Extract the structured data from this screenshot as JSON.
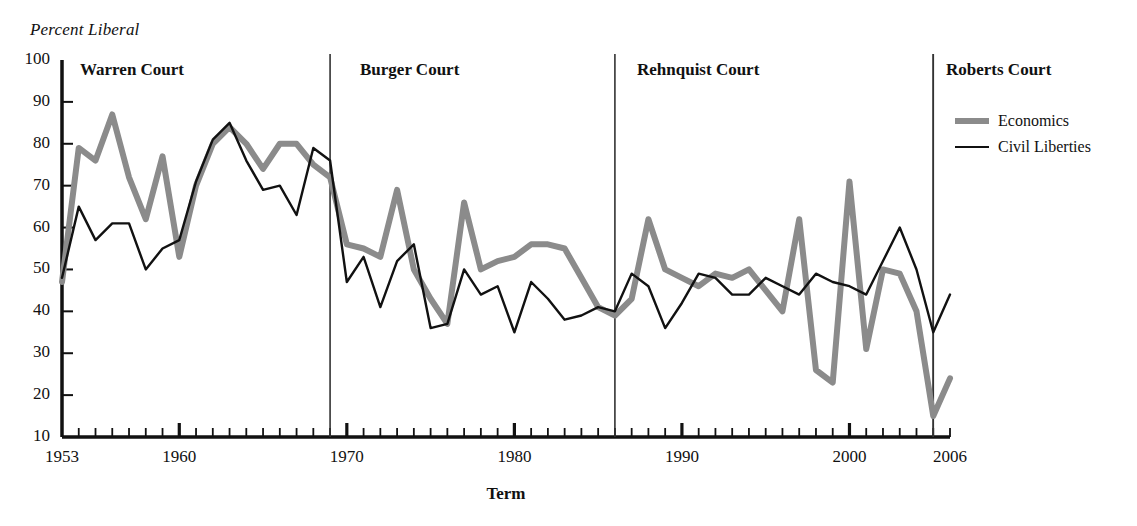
{
  "axis_title_y": "Percent Liberal",
  "axis_title_x": "Term",
  "legend": {
    "items": [
      {
        "label": "Economics",
        "color": "#8b8b8b",
        "style": "thick"
      },
      {
        "label": "Civil Liberties",
        "color": "#111111",
        "style": "thin"
      }
    ]
  },
  "courts": [
    {
      "name": "Warren Court",
      "start_year": 1953,
      "divider_year": null
    },
    {
      "name": "Burger Court",
      "start_year": 1969,
      "divider_year": 1969
    },
    {
      "name": "Rehnquist Court",
      "start_year": 1986,
      "divider_year": 1986
    },
    {
      "name": "Roberts Court",
      "start_year": 2005,
      "divider_year": 2005
    }
  ],
  "y_ticks": [
    10,
    20,
    30,
    40,
    50,
    60,
    70,
    80,
    90,
    100
  ],
  "x_tick_labels": [
    {
      "year": 1953,
      "text": "1953"
    },
    {
      "year": 1960,
      "text": "1960"
    },
    {
      "year": 1970,
      "text": "1970"
    },
    {
      "year": 1980,
      "text": "1980"
    },
    {
      "year": 1990,
      "text": "1990"
    },
    {
      "year": 2000,
      "text": "2000"
    },
    {
      "year": 2006,
      "text": "2006"
    }
  ],
  "colors": {
    "economics": "#8b8b8b",
    "civil_liberties": "#111111",
    "axis": "#111111",
    "divider": "#333333",
    "background": "#ffffff"
  },
  "chart_data": {
    "type": "line",
    "title": "",
    "xlabel": "Term",
    "ylabel": "Percent Liberal",
    "xlim": [
      1953,
      2006
    ],
    "ylim": [
      10,
      100
    ],
    "grid": false,
    "legend_position": "right",
    "x": [
      1953,
      1954,
      1955,
      1956,
      1957,
      1958,
      1959,
      1960,
      1961,
      1962,
      1963,
      1964,
      1965,
      1966,
      1967,
      1968,
      1969,
      1970,
      1971,
      1972,
      1973,
      1974,
      1975,
      1976,
      1977,
      1978,
      1979,
      1980,
      1981,
      1982,
      1983,
      1984,
      1985,
      1986,
      1987,
      1988,
      1989,
      1990,
      1991,
      1992,
      1993,
      1994,
      1995,
      1996,
      1997,
      1998,
      1999,
      2000,
      2001,
      2002,
      2003,
      2004,
      2005,
      2006
    ],
    "series": [
      {
        "name": "Economics",
        "color": "#8b8b8b",
        "values": [
          47,
          79,
          76,
          87,
          72,
          62,
          77,
          53,
          70,
          80,
          84,
          80,
          74,
          80,
          80,
          75,
          72,
          56,
          55,
          53,
          69,
          50,
          43,
          37,
          66,
          50,
          52,
          53,
          56,
          56,
          55,
          48,
          41,
          39,
          43,
          62,
          50,
          48,
          46,
          49,
          48,
          50,
          45,
          40,
          62,
          26,
          23,
          71,
          31,
          50,
          49,
          40,
          15,
          24
        ]
      },
      {
        "name": "Civil Liberties",
        "color": "#111111",
        "values": [
          48,
          65,
          57,
          61,
          61,
          50,
          55,
          57,
          71,
          81,
          85,
          76,
          69,
          70,
          63,
          79,
          76,
          47,
          53,
          41,
          52,
          56,
          36,
          37,
          50,
          44,
          46,
          35,
          47,
          43,
          38,
          39,
          41,
          40,
          49,
          46,
          36,
          42,
          49,
          48,
          44,
          44,
          48,
          46,
          44,
          49,
          47,
          46,
          44,
          52,
          60,
          50,
          35,
          44
        ]
      }
    ],
    "annotations": [
      {
        "text": "Warren Court",
        "x_year": 1954
      },
      {
        "text": "Burger Court",
        "x_year": 1970
      },
      {
        "text": "Rehnquist Court",
        "x_year": 1987
      },
      {
        "text": "Roberts Court",
        "x_year": 2005
      }
    ]
  }
}
